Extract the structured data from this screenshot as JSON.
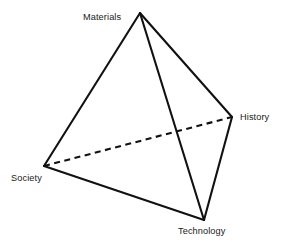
{
  "diagram": {
    "type": "tetrahedron",
    "shape_name": "tetrahedron-diagram",
    "background_color": "#ffffff",
    "stroke_color": "#111111",
    "vertices": [
      {
        "id": "materials",
        "label": "Materials",
        "x": 140,
        "y": 13,
        "label_x": 83,
        "label_y": 12
      },
      {
        "id": "history",
        "label": "History",
        "x": 232,
        "y": 117,
        "label_x": 240,
        "label_y": 112
      },
      {
        "id": "society",
        "label": "Society",
        "x": 44,
        "y": 166,
        "label_x": 11,
        "label_y": 173
      },
      {
        "id": "technology",
        "label": "Technology",
        "x": 204,
        "y": 220,
        "label_x": 178,
        "label_y": 226
      }
    ],
    "edges": [
      {
        "id": "materials-society",
        "from": "materials",
        "to": "society",
        "style": "solid"
      },
      {
        "id": "materials-history",
        "from": "materials",
        "to": "history",
        "style": "solid"
      },
      {
        "id": "materials-technology",
        "from": "materials",
        "to": "technology",
        "style": "solid"
      },
      {
        "id": "society-technology",
        "from": "society",
        "to": "technology",
        "style": "solid"
      },
      {
        "id": "history-technology",
        "from": "history",
        "to": "technology",
        "style": "solid"
      },
      {
        "id": "society-history",
        "from": "society",
        "to": "history",
        "style": "dashed"
      }
    ]
  }
}
